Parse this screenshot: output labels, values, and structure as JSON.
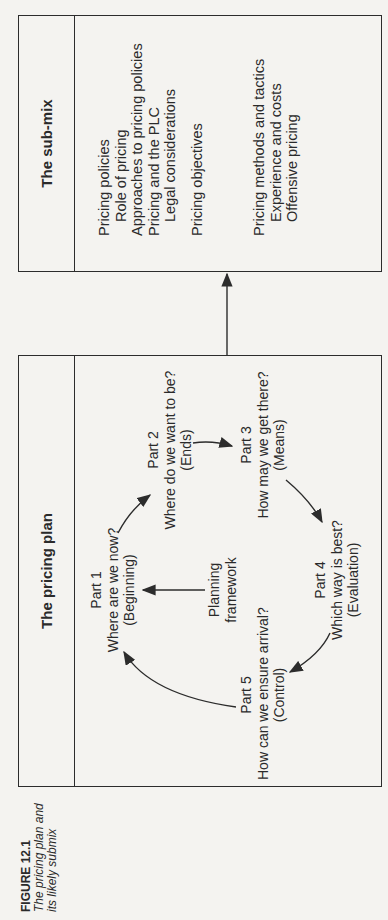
{
  "caption": {
    "figure_label": "FIGURE 12.1",
    "line1": "The pricing plan and",
    "line2": "its likely submix"
  },
  "pricing_plan": {
    "title": "The pricing plan",
    "center": {
      "line1": "Planning",
      "line2": "framework"
    },
    "parts": [
      {
        "label": "Part 1",
        "question": "Where are we now?",
        "tag": "(Beginning)"
      },
      {
        "label": "Part 2",
        "question": "Where do we want to be?",
        "tag": "(Ends)"
      },
      {
        "label": "Part 3",
        "question": "How may we get there?",
        "tag": "(Means)"
      },
      {
        "label": "Part 4",
        "question": "Which way is best?",
        "tag": "(Evaluation)"
      },
      {
        "label": "Part 5",
        "question": "How can we ensure arrival?",
        "tag": "(Control)"
      }
    ]
  },
  "sub_mix": {
    "title": "The sub-mix",
    "groups": [
      {
        "heading": "Pricing policies",
        "items": [
          "Role of pricing",
          "Approaches to pricing policies",
          "Pricing and the PLC",
          "Legal considerations"
        ]
      },
      {
        "heading": "Pricing objectives",
        "items": []
      },
      {
        "heading": "Pricing methods and tactics",
        "items": [
          "Experience and costs",
          "Offensive pricing"
        ]
      }
    ]
  },
  "colors": {
    "line": "#2c2c2c",
    "text": "#2a2a2a",
    "paper": "#f4f3f0"
  }
}
